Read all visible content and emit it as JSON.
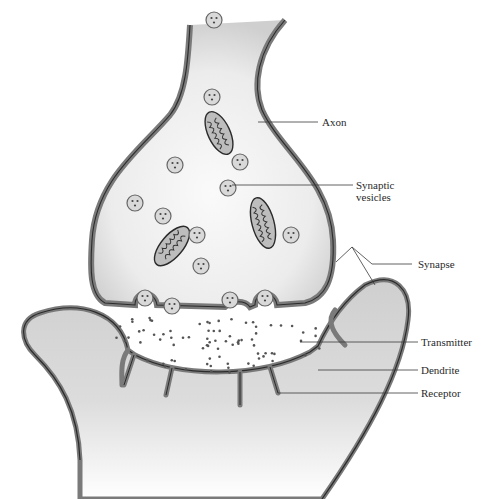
{
  "diagram": {
    "labels": {
      "axon": "Axon",
      "synaptic_vesicles_line1": "Synaptic",
      "synaptic_vesicles_line2": "vesicles",
      "synapse": "Synapse",
      "transmitter": "Transmitter",
      "dendrite": "Dendrite",
      "receptor": "Receptor"
    },
    "colors": {
      "membrane_dark": "#2b2b2b",
      "membrane_mid": "#7a7a7a",
      "cytoplasm_light": "#f2f2f2",
      "dendrite_fill": "#d6d6d6",
      "vesicle_fill": "#d9d9d9",
      "dot": "#555555"
    }
  }
}
